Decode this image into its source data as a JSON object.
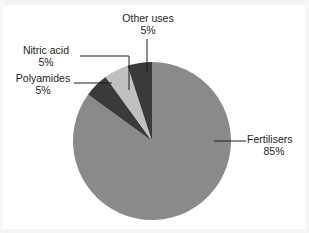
{
  "chart_data": {
    "type": "pie",
    "title": "",
    "subtitle": "",
    "xlabel": "",
    "ylabel": "",
    "legend_position": "none",
    "grid": false,
    "units": "percent",
    "start_angle_deg": 0,
    "direction": "clockwise",
    "categories": [
      "Fertilisers",
      "Other uses",
      "Nitric acid",
      "Polyamides"
    ],
    "values": [
      85,
      5,
      5,
      5
    ],
    "slices": [
      {
        "label": "Fertilisers",
        "value": 85,
        "value_text": "85%",
        "color": "#8a8a8a",
        "start_deg": 0,
        "end_deg": 306,
        "label_position": "right",
        "leader": "horizontal"
      },
      {
        "label": "Polyamides",
        "value": 5,
        "value_text": "5%",
        "color": "#3a3a3a",
        "start_deg": 306,
        "end_deg": 324,
        "label_position": "left",
        "leader": "horizontal"
      },
      {
        "label": "Nitric acid",
        "value": 5,
        "value_text": "5%",
        "color": "#c0c0c0",
        "start_deg": 324,
        "end_deg": 342,
        "label_position": "upper-left",
        "leader": "elbow"
      },
      {
        "label": "Other uses",
        "value": 5,
        "value_text": "5%",
        "color": "#3a3a3a",
        "start_deg": 342,
        "end_deg": 360,
        "label_position": "top",
        "leader": "vertical"
      }
    ]
  },
  "labels": {
    "other_uses": {
      "name": "Other uses",
      "percent": "5%"
    },
    "nitric_acid": {
      "name": "Nitric acid",
      "percent": "5%"
    },
    "polyamides": {
      "name": "Polyamides",
      "percent": "5%"
    },
    "fertilisers": {
      "name": "Fertilisers",
      "percent": "85%"
    }
  },
  "colors": {
    "background": "#ffffff",
    "fertilisers": "#8a8a8a",
    "polyamides": "#3a3a3a",
    "nitric_acid": "#c0c0c0",
    "other_uses": "#3a3a3a",
    "leader_line": "#1c1c1c",
    "text": "#1c1c1c"
  }
}
